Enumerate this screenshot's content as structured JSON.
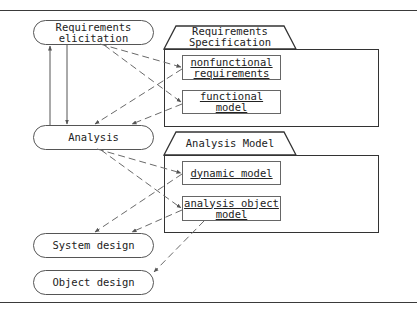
{
  "activities": {
    "requirements_elicitation": {
      "line1": "Requirements",
      "line2": "elicitation"
    },
    "analysis": {
      "label": "Analysis"
    },
    "system_design": {
      "label": "System design"
    },
    "object_design": {
      "label": "Object design"
    }
  },
  "packages": {
    "requirements_specification": {
      "title_line1": "Requirements",
      "title_line2": "Specification",
      "artifacts": [
        {
          "line1": "nonfunctional",
          "line2": "requirements"
        },
        {
          "line1": "functional",
          "line2": "model"
        }
      ]
    },
    "analysis_model": {
      "title": "Analysis Model",
      "artifacts": [
        {
          "line1": "dynamic model"
        },
        {
          "line1": "analysis object",
          "line2": "model"
        }
      ]
    }
  },
  "connections": [
    {
      "from": "Requirements elicitation",
      "to": "Analysis",
      "style": "solid"
    },
    {
      "from": "Analysis",
      "to": "Requirements elicitation",
      "style": "solid"
    },
    {
      "from": "Requirements elicitation",
      "to": "nonfunctional requirements",
      "style": "dashed"
    },
    {
      "from": "Requirements elicitation",
      "to": "functional model",
      "style": "dashed"
    },
    {
      "from": "nonfunctional requirements",
      "to": "Analysis",
      "style": "dashed"
    },
    {
      "from": "functional model",
      "to": "Analysis",
      "style": "dashed"
    },
    {
      "from": "Analysis",
      "to": "dynamic model",
      "style": "dashed"
    },
    {
      "from": "Analysis",
      "to": "analysis object model",
      "style": "dashed"
    },
    {
      "from": "dynamic model",
      "to": "System design",
      "style": "dashed"
    },
    {
      "from": "analysis object model",
      "to": "System design",
      "style": "dashed"
    },
    {
      "from": "analysis object model",
      "to": "Object design",
      "style": "dashed"
    }
  ],
  "colors": {
    "line": "#555555",
    "dashed": "#6a6a6a",
    "border": "#333333",
    "background": "#ffffff"
  }
}
